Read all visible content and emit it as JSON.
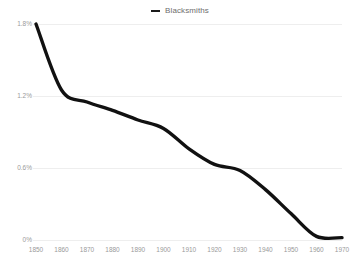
{
  "legend": {
    "position": "top-center",
    "items": [
      {
        "label": "Blacksmiths",
        "marker": "dash-icon",
        "color": "#1a1a1a"
      }
    ]
  },
  "axes": {
    "y_ticks": [
      "0%",
      "0.6%",
      "1.2%",
      "1.8%"
    ],
    "x_ticks": [
      "1850",
      "1860",
      "1870",
      "1880",
      "1890",
      "1900",
      "1910",
      "1920",
      "1930",
      "1940",
      "1950",
      "1960",
      "1970"
    ]
  },
  "style": {
    "line_color": "#111111",
    "grid_color": "#eeeeee",
    "tick_text_color": "#9a9a9a",
    "background": "#ffffff"
  },
  "chart_data": {
    "type": "line",
    "title": "",
    "subtitle": "",
    "xlabel": "",
    "ylabel": "",
    "xlim": [
      1850,
      1970
    ],
    "ylim": [
      0,
      1.8
    ],
    "grid": "horizontal",
    "legend_position": "top-center",
    "x": [
      1850,
      1860,
      1870,
      1880,
      1890,
      1900,
      1910,
      1920,
      1930,
      1940,
      1950,
      1960,
      1970
    ],
    "series": [
      {
        "name": "Blacksmiths",
        "color": "#111111",
        "units": "percent of workforce",
        "values": [
          1.8,
          1.25,
          1.15,
          1.08,
          1.0,
          0.93,
          0.76,
          0.63,
          0.58,
          0.42,
          0.22,
          0.03,
          0.02
        ]
      }
    ],
    "annotations": []
  }
}
